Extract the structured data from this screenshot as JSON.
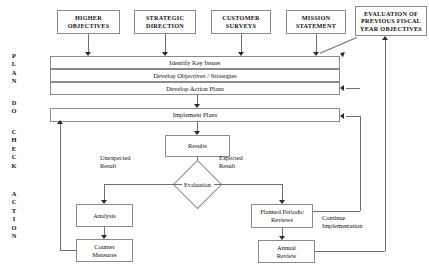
{
  "diagram": {
    "type": "flowchart",
    "phases": [
      {
        "id": "plan",
        "letters": [
          "P",
          "L",
          "A",
          "N"
        ]
      },
      {
        "id": "do",
        "letters": [
          "D",
          "O"
        ]
      },
      {
        "id": "check",
        "letters": [
          "C",
          "H",
          "E",
          "C",
          "K"
        ]
      },
      {
        "id": "action",
        "letters": [
          "A",
          "C",
          "T",
          "I",
          "O",
          "N"
        ]
      }
    ],
    "inputs": [
      {
        "id": "higher-objectives",
        "label": "HIGHER\nOBJECTIVES"
      },
      {
        "id": "strategic-direction",
        "label": "STRATEGIC\nDIRECTION"
      },
      {
        "id": "customer-surveys",
        "label": "CUSTOMER\nSURVEYS"
      },
      {
        "id": "mission-statement",
        "label": "MISSION\nSTATEMENT"
      },
      {
        "id": "evaluation-previous",
        "label": "EVALUATION OF\nPREVIOUS FISCAL\nYEAR OBJECTIVES"
      }
    ],
    "plan_bands": [
      {
        "id": "identify-key-issues",
        "label": "Identify Key Issues"
      },
      {
        "id": "develop-objectives",
        "label": "Develop Objectives / Strategies"
      },
      {
        "id": "develop-action-plans",
        "label": "Develop Action Plans"
      }
    ],
    "do_band": {
      "id": "implement-plans",
      "label": "Implement Plans"
    },
    "check_nodes": [
      {
        "id": "results",
        "label": "Results"
      },
      {
        "id": "evaluation",
        "label": "Evaluation"
      }
    ],
    "branch_labels": [
      {
        "id": "unexpected-result",
        "label": "Unexpected\nResult"
      },
      {
        "id": "expected-result",
        "label": "Expected\nResult"
      }
    ],
    "action_nodes": [
      {
        "id": "analysis",
        "label": "Analysis"
      },
      {
        "id": "counter-measures",
        "label": "Counter\nMeasures"
      },
      {
        "id": "planned-periodic-reviews",
        "label": "Planned Periodic\nReviews"
      },
      {
        "id": "annual-review",
        "label": "Annual\nReview"
      }
    ],
    "feedback_labels": [
      {
        "id": "continue-implementation",
        "label": "Continue\nImplementation"
      }
    ],
    "colors": {
      "background": "#ffffff",
      "box_border": "#8a8a8a",
      "connector": "#6f6f6f",
      "arrowhead": "#2b2b2b",
      "text": "#111111"
    }
  }
}
